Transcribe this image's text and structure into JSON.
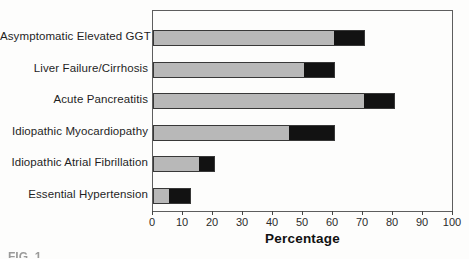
{
  "figure": {
    "caption_partial": "FIG. 1",
    "background": "#fdfdfc"
  },
  "chart_data": {
    "type": "bar",
    "orientation": "horizontal",
    "stacked": true,
    "title": "",
    "xlabel": "Percentage",
    "ylabel": "",
    "xlim": [
      0,
      100
    ],
    "xticks": [
      0,
      10,
      20,
      30,
      40,
      50,
      60,
      70,
      80,
      90,
      100
    ],
    "grid": false,
    "legend_position": "none",
    "categories": [
      "Asymptomatic Elevated GGT",
      "Liver Failure/Cirrhosis",
      "Acute Pancreatitis",
      "Idiopathic Myocardiopathy",
      "Idiopathic Atrial Fibrillation",
      "Essential Hypertension"
    ],
    "series": [
      {
        "name": "gray-segment",
        "color": "#b8b8b8",
        "values": [
          60,
          50,
          70,
          45,
          15,
          5
        ]
      },
      {
        "name": "black-segment",
        "color": "#121212",
        "values": [
          10,
          10,
          10,
          15,
          5,
          7
        ]
      }
    ],
    "totals": [
      70,
      60,
      80,
      60,
      20,
      12
    ]
  },
  "colors": {
    "plot_frame": "#5e5e5e",
    "bar_border": "#383838",
    "tick": "#444444",
    "tick_label": "#2b2b2b",
    "category_label": "#1f1f1f",
    "axis_title": "#111111"
  }
}
